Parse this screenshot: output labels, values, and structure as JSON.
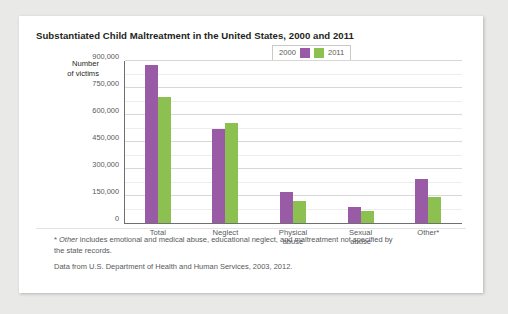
{
  "card": {
    "title": "Substantiated Child Maltreatment in the United States, 2000 and 2011",
    "axis_caption_line1": "Number",
    "axis_caption_line2": "of victims",
    "footnote_asterisk": "*",
    "footnote_italic_word": "Other",
    "footnote_rest": " includes emotional and medical abuse, educational neglect, and maltreatment not specified by the state records.",
    "source": "Data from U.S. Department of Health and Human Services, 2003, 2012."
  },
  "chart_data": {
    "type": "bar",
    "title": "Substantiated Child Maltreatment in the United States, 2000 and 2011",
    "xlabel": "",
    "ylabel": "Number of victims",
    "ylim": [
      0,
      900000
    ],
    "ytick_values": [
      0,
      150000,
      300000,
      450000,
      600000,
      750000,
      900000
    ],
    "ytick_labels": [
      "0",
      "150,000",
      "300,000",
      "450,000",
      "600,000",
      "750,000",
      "900,000"
    ],
    "minor_gridline_step": 75000,
    "grid": true,
    "legend_position": "top-right",
    "categories": [
      "Total",
      "Neglect",
      "Physical abuse",
      "Sexual abuse",
      "Other*"
    ],
    "category_lines": [
      [
        "Total"
      ],
      [
        "Neglect"
      ],
      [
        "Physical",
        "abuse"
      ],
      [
        "Sexual",
        "abuse"
      ],
      [
        "Other*"
      ]
    ],
    "series": [
      {
        "name": "2000",
        "color": "#9a5ba6",
        "values": [
          879000,
          520000,
          170000,
          90000,
          245000
        ]
      },
      {
        "name": "2011",
        "color": "#8cc152",
        "values": [
          700000,
          555000,
          125000,
          65000,
          145000
        ]
      }
    ]
  }
}
